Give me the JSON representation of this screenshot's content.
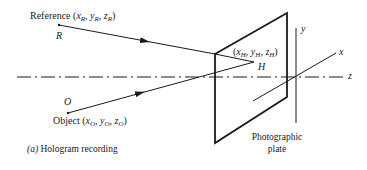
{
  "figure": {
    "caption_marker": "(a)",
    "caption_text": "Hologram recording",
    "reference": {
      "label": "Reference",
      "coords": {
        "x": "x",
        "x_sub": "R",
        "y": "y",
        "y_sub": "R",
        "z": "z",
        "z_sub": "R"
      },
      "point": "R"
    },
    "object": {
      "label": "Object",
      "coords": {
        "x": "x",
        "x_sub": "O",
        "y": "y",
        "y_sub": "O",
        "z": "z",
        "z_sub": "O"
      },
      "point": "O"
    },
    "hologram_point": {
      "coords": {
        "x": "x",
        "x_sub": "H",
        "y": "y",
        "y_sub": "H",
        "z": "z",
        "z_sub": "H"
      },
      "point": "H"
    },
    "plate_label_line1": "Photographic",
    "plate_label_line2": "plate",
    "axes": {
      "x": "x",
      "y": "y",
      "z": "z"
    },
    "colors": {
      "ink": "#1a1a1a",
      "background": "#ffffff"
    }
  }
}
